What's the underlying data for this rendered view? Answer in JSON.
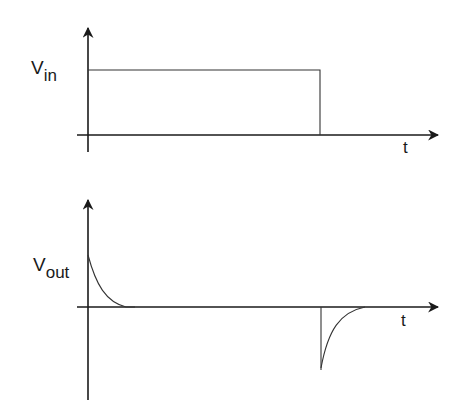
{
  "diagram": {
    "top_plot": {
      "y_label": {
        "main": "V",
        "sub": "in"
      },
      "x_label": "t",
      "signal": "rectangular pulse"
    },
    "bottom_plot": {
      "y_label": {
        "main": "V",
        "sub": "out"
      },
      "x_label": "t",
      "signal": "positive exponential spike at rising edge, negative exponential spike at falling edge"
    },
    "colors": {
      "line": "#1a1a1a",
      "background": "#ffffff"
    }
  }
}
